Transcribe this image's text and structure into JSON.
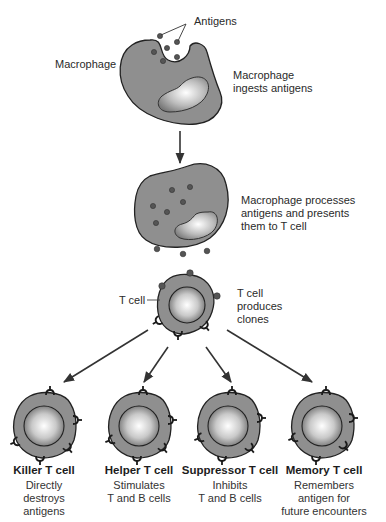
{
  "diagram": {
    "stage1": {
      "antigens_label": "Antigens",
      "cell_label": "Macrophage",
      "caption": [
        "Macrophage",
        "ingests antigens"
      ]
    },
    "stage2": {
      "caption": [
        "Macrophage processes",
        "antigens and presents",
        "them to T cell"
      ]
    },
    "stage3": {
      "cell_label": "T cell",
      "caption": [
        "T cell",
        "produces",
        "clones"
      ]
    },
    "clones": [
      {
        "title": "Killer T cell",
        "desc": [
          "Directly",
          "destroys",
          "antigens"
        ]
      },
      {
        "title": "Helper T cell",
        "desc": [
          "Stimulates",
          "T and B cells"
        ]
      },
      {
        "title": "Suppressor T cell",
        "desc": [
          "Inhibits",
          "T and B cells"
        ]
      },
      {
        "title": "Memory T cell",
        "desc": [
          "Remembers",
          "antigen for",
          "future encounters"
        ]
      }
    ],
    "colors": {
      "cell_fill": "#8f8f8f",
      "outline": "#222222",
      "nucleus_light": "#f4f4f4",
      "nucleus_dark": "#7a7a7a",
      "antigen": "#555555",
      "arrow": "#333333"
    }
  }
}
